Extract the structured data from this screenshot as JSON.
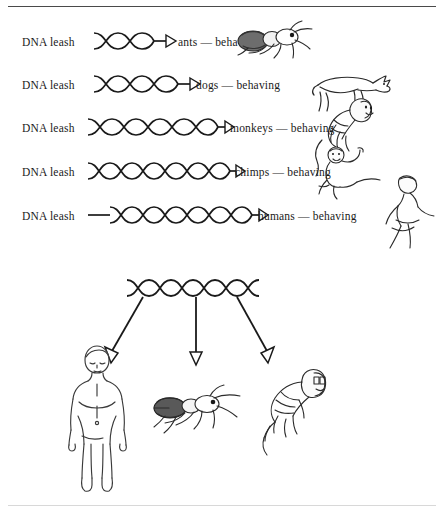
{
  "figure": {
    "rows": [
      {
        "leash_label": "DNA leash",
        "species_label": "ants — behaving",
        "helix_coils": 2,
        "lead_in": 0,
        "helix_width": 70,
        "label_x": 178,
        "creature": "ant-illustration"
      },
      {
        "leash_label": "DNA leash",
        "species_label": "dogs — behaving",
        "helix_coils": 3,
        "lead_in": 0,
        "helix_width": 96,
        "label_x": 196,
        "creature": "dog-illustration"
      },
      {
        "leash_label": "DNA leash",
        "species_label": "monkeys — behaving",
        "helix_coils": 5,
        "lead_in": 0,
        "helix_width": 134,
        "label_x": 230,
        "creature": "monkey-illustration"
      },
      {
        "leash_label": "DNA leash",
        "species_label": "chimps — behaving",
        "helix_coils": 6,
        "lead_in": 0,
        "helix_width": 152,
        "label_x": 235,
        "creature": "chimp-illustration"
      },
      {
        "leash_label": "DNA leash",
        "species_label": "humans — behaving",
        "helix_coils": 6,
        "lead_in": 22,
        "helix_width": 176,
        "label_x": 258,
        "creature": "human-standing-illustration"
      }
    ],
    "branch": {
      "helix_coils": 6,
      "helix_width": 132,
      "targets": [
        {
          "name": "human-figure"
        },
        {
          "name": "ant-figure"
        },
        {
          "name": "monkey-figure"
        }
      ]
    },
    "colors": {
      "ink": "#1a1a1a",
      "rule": "#4a4a4a",
      "paper": "#ffffff"
    }
  }
}
